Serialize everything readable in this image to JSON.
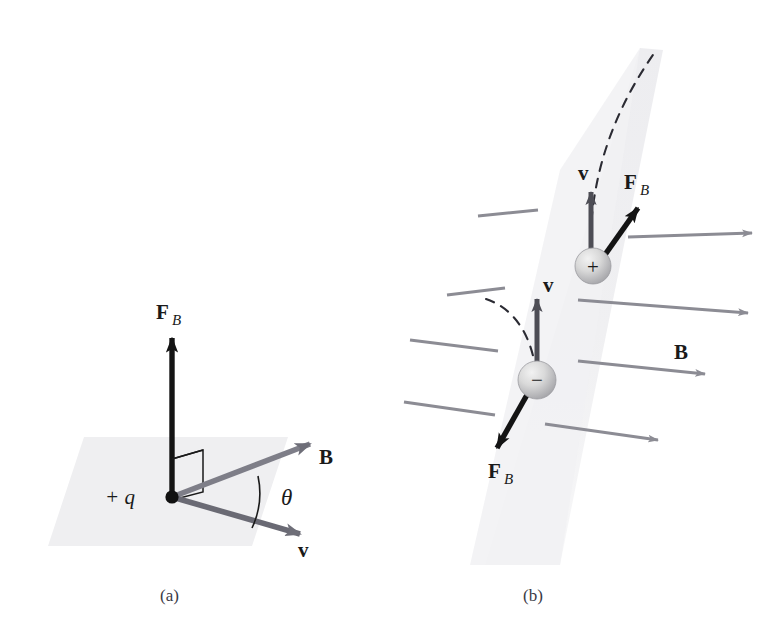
{
  "figure": {
    "background_color": "#ffffff",
    "plane_fill": "#efeff1",
    "field_arrow_color": "#8c8c94",
    "force_arrow_color": "#1a1a1a",
    "velocity_arrow_color": "#4d4d55",
    "sphere_color": "#d0d0d0",
    "text_color": "#1a1a1a",
    "caption_color": "#3a3a46"
  },
  "panel_a": {
    "caption": "(a)",
    "charge_label": "+ q",
    "force_label": "F",
    "force_subscript": "B",
    "field_label": "B",
    "velocity_label": "v",
    "angle_label": "θ",
    "right_angle_marker": "right-angle",
    "description": "Positive charge q at origin with magnetic force F_B perpendicular (vertical) to the plane containing B and v, which are separated by angle theta."
  },
  "panel_b": {
    "caption": "(b)",
    "field_label": "B",
    "positive_charge": {
      "sign": "+",
      "velocity_label": "v",
      "force_label": "F",
      "force_subscript": "B",
      "trajectory": "dashed-curve-up-right"
    },
    "negative_charge": {
      "sign": "−",
      "velocity_label": "v",
      "force_label": "F",
      "force_subscript": "B",
      "trajectory": "dashed-curve-up-left"
    },
    "field_line_count": 4,
    "description": "Uniform magnetic field B pointing right; a positive charge moving up feels force up-right, a negative charge moving up feels force down-left."
  }
}
